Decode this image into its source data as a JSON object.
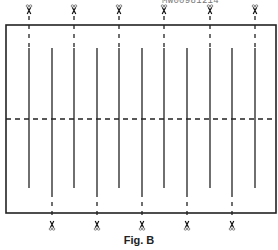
{
  "figure": {
    "caption": "Fig. B",
    "code_label": "MW00981214",
    "frame": {
      "x": 6,
      "y": 25,
      "width": 270,
      "height": 188,
      "stroke": "#222222"
    },
    "horizontal_cut_line_y": 119,
    "top_cut_lines_x": [
      29,
      74,
      119,
      164,
      210,
      255
    ],
    "bottom_cut_lines_x": [
      52,
      97,
      142,
      187,
      232
    ],
    "icons": {
      "top_marks": "scissors-icon",
      "bottom_marks": "scissors-icon"
    }
  }
}
